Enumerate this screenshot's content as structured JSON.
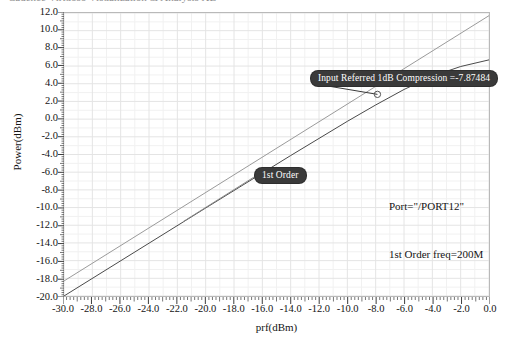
{
  "window": {
    "title_strip": "Cadence Virtuoso Visualization & Analysis XL"
  },
  "chart_data": {
    "type": "line",
    "title": "",
    "xlabel": "prf(dBm)",
    "ylabel": "Power(dBm)",
    "xlim": [
      -30.0,
      0.0
    ],
    "ylim": [
      -20.0,
      12.0
    ],
    "xticks": [
      "-30.0",
      "-28.0",
      "-26.0",
      "-24.0",
      "-22.0",
      "-20.0",
      "-18.0",
      "-16.0",
      "-14.0",
      "-12.0",
      "-10.0",
      "-8.0",
      "-6.0",
      "-4.0",
      "-2.0",
      "0.0"
    ],
    "yticks": [
      "12.0",
      "10.0",
      "8.0",
      "6.0",
      "4.0",
      "2.0",
      "0.0",
      "-2.0",
      "-4.0",
      "-6.0",
      "-8.0",
      "-10.0",
      "-12.0",
      "-14.0",
      "-16.0",
      "-18.0",
      "-20.0"
    ],
    "xtick_values": [
      -30,
      -28,
      -26,
      -24,
      -22,
      -20,
      -18,
      -16,
      -14,
      -12,
      -10,
      -8,
      -6,
      -4,
      -2,
      0
    ],
    "ytick_values": [
      12,
      10,
      8,
      6,
      4,
      2,
      0,
      -2,
      -4,
      -6,
      -8,
      -10,
      -12,
      -14,
      -16,
      -18,
      -20
    ],
    "grid": true,
    "legend": "none",
    "series": [
      {
        "name": "1st Order",
        "role": "ideal-extrapolation",
        "color": "#9a9a9a",
        "x": [
          -30,
          0
        ],
        "values": [
          -18.3,
          11.7
        ]
      },
      {
        "name": "Output Power",
        "role": "measured",
        "color": "#4a4a4a",
        "x": [
          -30,
          -20,
          -14,
          -10,
          -8,
          -6,
          -4,
          -2,
          0
        ],
        "values": [
          -20.0,
          -10.05,
          -4.12,
          -0.25,
          1.6,
          3.35,
          4.85,
          5.95,
          6.7
        ]
      }
    ],
    "markers": [
      {
        "name": "compression-point",
        "x": -7.87484,
        "y": 2.8
      }
    ]
  },
  "annotations": {
    "compression": {
      "label": "Input Referred 1dB Compression =-7.87484",
      "value": "-7.87484"
    },
    "first_order": {
      "label": "1st Order"
    },
    "port": {
      "label": "Port=\"/PORT12\""
    },
    "freq": {
      "label": "1st Order freq=200M"
    }
  },
  "colors": {
    "frame": "#b9b9b9",
    "grid_major": "#e4e4e4",
    "grid_minor": "#f1f1f1",
    "ideal_line": "#9a9a9a",
    "measured_line": "#4a4a4a",
    "pill_bg": "#3a3a3a",
    "pill_text": "#ffffff",
    "text": "#141414"
  }
}
